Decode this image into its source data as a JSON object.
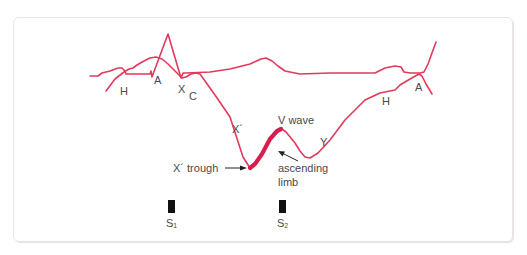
{
  "diagram": {
    "colors": {
      "trace": "#e03a5c",
      "highlight": "#d81e4e",
      "text": "#4a4a4a",
      "marker": "#111111",
      "frame": "#ece4e6"
    },
    "ecg_trace": {
      "labels": []
    },
    "jvp_trace": {
      "labels": {
        "h_left": "H",
        "a_left": "A",
        "x": "X",
        "c": "C",
        "x_prime": "X´",
        "v_wave": "V wave",
        "y": "Y",
        "h_right": "H",
        "a_right": "A"
      }
    },
    "annotations": {
      "x_trough": "X´ trough",
      "ascending_limb_line1": "ascending",
      "ascending_limb_line2": "limb"
    },
    "heart_sounds": {
      "s1_main": "S",
      "s1_sub": "1",
      "s2_main": "S",
      "s2_sub": "2"
    }
  }
}
